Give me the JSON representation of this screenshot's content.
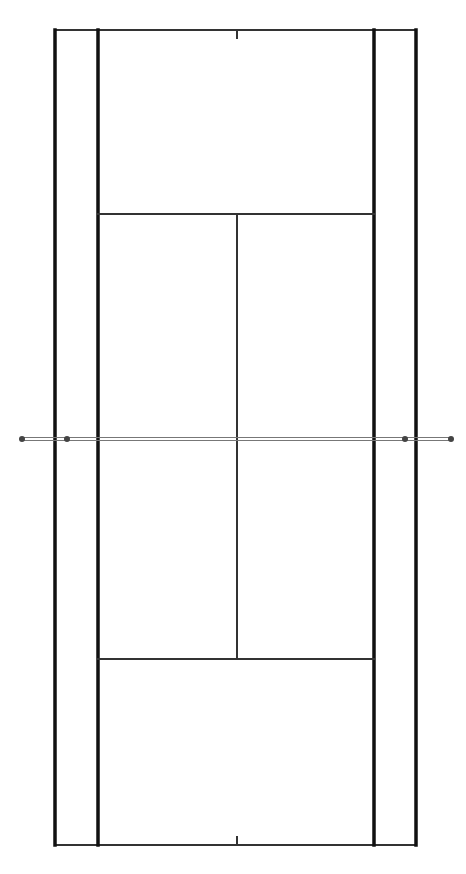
{
  "diagram": {
    "colors": {
      "background": "#ffffff",
      "line": "#111111",
      "thin_line": "#333333",
      "net": "#777777",
      "post": "#444444"
    },
    "court": {
      "doubles_left_x": 55,
      "singles_left_x": 98,
      "singles_right_x": 374,
      "doubles_right_x": 416,
      "top_baseline_y": 30,
      "bottom_baseline_y": 845,
      "top_service_line_y": 214,
      "bottom_service_line_y": 659,
      "center_x": 237,
      "center_mark_length": 8
    },
    "net": {
      "y": 439,
      "x1": 22,
      "x2": 451,
      "posts": [
        22,
        67,
        405,
        451
      ]
    }
  }
}
